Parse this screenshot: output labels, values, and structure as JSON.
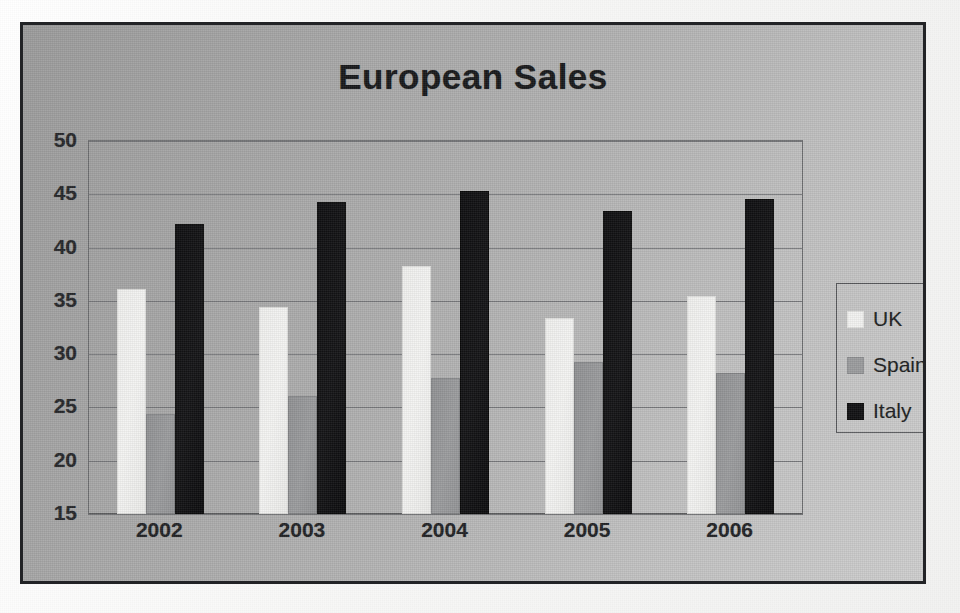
{
  "chart_data": {
    "type": "bar",
    "title": "European Sales",
    "xlabel": "",
    "ylabel": "",
    "categories": [
      "2002",
      "2003",
      "2004",
      "2005",
      "2006"
    ],
    "series": [
      {
        "name": "UK",
        "color": "#f2f2f0",
        "values": [
          36.1,
          34.4,
          38.3,
          33.4,
          35.5
        ]
      },
      {
        "name": "Spain",
        "color": "#9a9b9d",
        "values": [
          24.4,
          26.1,
          27.8,
          29.3,
          28.2
        ]
      },
      {
        "name": "Italy",
        "color": "#101012",
        "values": [
          42.2,
          44.3,
          45.3,
          43.4,
          44.6
        ]
      }
    ],
    "ylim": [
      15,
      50
    ],
    "yticks": [
      15,
      20,
      25,
      30,
      35,
      40,
      45,
      50
    ],
    "ytick_labels": [
      "15",
      "20",
      "25",
      "30",
      "35",
      "40",
      "45",
      "50"
    ],
    "grid": true,
    "legend_position": "right",
    "background_color": "#b0b0b0",
    "border_color": "#222326",
    "gridline_color": "#76777a"
  },
  "legend": {
    "items": [
      {
        "label": "UK",
        "swatch": "uk"
      },
      {
        "label": "Spain",
        "swatch": "spain"
      },
      {
        "label": "Italy",
        "swatch": "italy"
      }
    ]
  }
}
